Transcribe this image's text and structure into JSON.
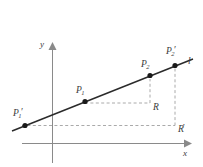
{
  "figure": {
    "type": "geometry-diagram",
    "colors": {
      "line": "#2b2b2b",
      "axis": "#8a8a8a",
      "dashed": "#9a9a9a",
      "point": "#1a1a1a",
      "label": "#3b3b3b",
      "background": "#ffffff"
    },
    "axes": {
      "x_label": "x",
      "y_label": "y"
    },
    "line_label": "l",
    "points": [
      {
        "id": "p1prime",
        "base": "P",
        "sub": "1",
        "prime": "′",
        "x": 25,
        "y": 125
      },
      {
        "id": "p1",
        "base": "P",
        "sub": "1",
        "prime": "",
        "x": 85,
        "y": 103
      },
      {
        "id": "p2",
        "base": "P",
        "sub": "2",
        "prime": "",
        "x": 150,
        "y": 79
      },
      {
        "id": "p2prime",
        "base": "P",
        "sub": "2",
        "prime": "′",
        "x": 175,
        "y": 65
      }
    ],
    "corners": [
      {
        "id": "r",
        "base": "R",
        "prime": "",
        "x": 150,
        "y": 103
      },
      {
        "id": "rprime",
        "base": "R",
        "prime": "′",
        "x": 175,
        "y": 125
      }
    ]
  }
}
